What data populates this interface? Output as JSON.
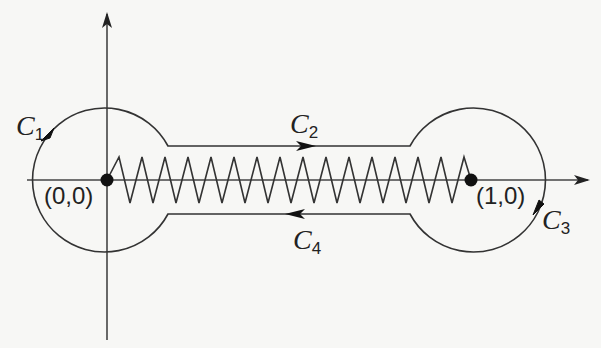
{
  "diagram": {
    "type": "contour-integration-keyhole",
    "labels": {
      "c1": {
        "letter": "C",
        "sub": "1"
      },
      "c2": {
        "letter": "C",
        "sub": "2"
      },
      "c3": {
        "letter": "C",
        "sub": "3"
      },
      "c4": {
        "letter": "C",
        "sub": "4"
      },
      "origin": "(0,0)",
      "point_one": "(1,0)"
    },
    "points": [
      {
        "name": "origin",
        "coords": [
          0,
          0
        ]
      },
      {
        "name": "one",
        "coords": [
          1,
          0
        ]
      }
    ],
    "branch_cut": {
      "from": [
        0,
        0
      ],
      "to": [
        1,
        0
      ],
      "style": "zigzag",
      "peaks": 16
    },
    "contours": [
      {
        "name": "C1",
        "shape": "circle-arc",
        "center": [
          0,
          0
        ],
        "direction": "clockwise"
      },
      {
        "name": "C2",
        "shape": "line",
        "direction": "right",
        "position": "above cut"
      },
      {
        "name": "C3",
        "shape": "circle-arc",
        "center": [
          1,
          0
        ],
        "direction": "clockwise"
      },
      {
        "name": "C4",
        "shape": "line",
        "direction": "left",
        "position": "below cut"
      }
    ],
    "colors": {
      "line": "#333333",
      "background": "#f7f7f5"
    }
  }
}
